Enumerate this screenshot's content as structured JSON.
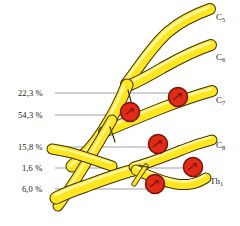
{
  "figure": {
    "background_color": "#ffffff",
    "nerve_fill_color": "#ffe61f",
    "nerve_highlight_color": "#fff59a",
    "nerve_outline_color": "#3a3000",
    "marker_fill_color": "#e02b17",
    "marker_edge_color": "#7a1405",
    "leader_line_color": "#8c8c8c",
    "text_color": "#1a1a1a"
  },
  "percent_labels": [
    {
      "id": "p1",
      "text": "22,3 %",
      "x": 18,
      "y": 88,
      "leader_y": 93,
      "leader_x1": 55,
      "leader_x2": 176
    },
    {
      "id": "p2",
      "text": "54,3 %",
      "x": 18,
      "y": 110,
      "leader_y": 115,
      "leader_x1": 55,
      "leader_x2": 128
    },
    {
      "id": "p3",
      "text": "15,8 %",
      "x": 18,
      "y": 142,
      "leader_y": 147,
      "leader_x1": 55,
      "leader_x2": 155
    },
    {
      "id": "p4",
      "text": "1,6 %",
      "x": 22,
      "y": 163,
      "leader_y": 168,
      "leader_x1": 55,
      "leader_x2": 190
    },
    {
      "id": "p5",
      "text": "6,0 %",
      "x": 22,
      "y": 184,
      "leader_y": 189,
      "leader_x1": 55,
      "leader_x2": 150
    }
  ],
  "root_labels": [
    {
      "id": "c5",
      "base": "C",
      "sub": "5",
      "x": 216,
      "y": 12
    },
    {
      "id": "c6",
      "base": "C",
      "sub": "6",
      "x": 216,
      "y": 52
    },
    {
      "id": "c7",
      "base": "C",
      "sub": "7",
      "x": 216,
      "y": 95
    },
    {
      "id": "c8",
      "base": "C",
      "sub": "8",
      "x": 216,
      "y": 140
    },
    {
      "id": "th1",
      "base": "Th",
      "sub": "1",
      "x": 210,
      "y": 176
    }
  ],
  "markers": [
    {
      "id": "m1",
      "cx": 178,
      "cy": 97,
      "r": 9.5
    },
    {
      "id": "m2",
      "cx": 130,
      "cy": 112,
      "r": 9.5
    },
    {
      "id": "m3",
      "cx": 158,
      "cy": 144,
      "r": 9.5
    },
    {
      "id": "m4",
      "cx": 193,
      "cy": 167,
      "r": 9.5
    },
    {
      "id": "m5",
      "cx": 155,
      "cy": 184,
      "r": 9.5
    }
  ],
  "chart_data": {
    "type": "diagram",
    "categories": [
      "22,3 %",
      "54,3 %",
      "15,8 %",
      "1,6 %",
      "6,0 %"
    ],
    "values": [
      22.3,
      54.3,
      15.8,
      1.6,
      6.0
    ],
    "unit": "%",
    "nodes": [
      "C5",
      "C6",
      "C7",
      "C8",
      "Th1"
    ],
    "legend_position": "none",
    "grid": false
  }
}
